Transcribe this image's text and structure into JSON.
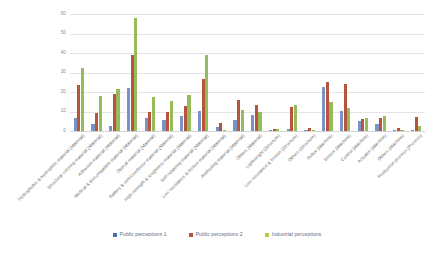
{
  "chart_data": {
    "type": "bar",
    "title": "",
    "subtitle": "",
    "xlabel": "",
    "ylabel": "",
    "ylim": [
      0,
      60
    ],
    "yticks": [
      0,
      10,
      20,
      30,
      40,
      50,
      60
    ],
    "ytick_labels": [
      "0",
      "10",
      "20",
      "30",
      "40",
      "50",
      "60"
    ],
    "grid": true,
    "legend_position": "bottom",
    "categories": [
      "Hydrophobic & hydrophilic material (Material)",
      "Structural coloring material (Material)",
      "Adhesive material (Material)",
      "Medical & biocompatible material (Material)",
      "Optical material (Material)",
      "Battery & semiconductor material (Material)",
      "High strength & toughness material (Material)",
      "Self-repairing material (Material)",
      "Low resistance & friction material (Material)",
      "Antifouling material (Material)",
      "Others (Material)",
      "Lightweight (Structure)",
      "Low resistance & friction (Structure)",
      "Others (Structure)",
      "Robot (Machine)",
      "Sensor (Machine)",
      "Control (Machine)",
      "Actuator (Machine)",
      "Others (Machine)",
      "Production process (Process)"
    ],
    "series": [
      {
        "name": "Public perceptions 1",
        "color": "#4a6fb5",
        "values": [
          6.5,
          3.5,
          2.5,
          22.0,
          6.5,
          5.5,
          7.5,
          10.5,
          2.0,
          5.5,
          8.0,
          0.5,
          1.0,
          0.5,
          22.5,
          10.5,
          5.0,
          3.5,
          0.3,
          0.5
        ]
      },
      {
        "name": "Public perceptions 2",
        "color": "#b4553c",
        "values": [
          23.5,
          9.0,
          19.0,
          39.0,
          10.0,
          10.0,
          13.0,
          26.5,
          4.0,
          16.0,
          13.5,
          1.0,
          12.5,
          1.5,
          25.0,
          24.0,
          6.0,
          6.5,
          1.5,
          7.0
        ]
      },
      {
        "name": "Industrial perceptions",
        "color": "#96bb5b",
        "values": [
          32.5,
          18.0,
          21.5,
          58.0,
          17.5,
          15.5,
          18.5,
          39.0,
          0.3,
          11.0,
          9.5,
          1.0,
          13.5,
          0.5,
          15.0,
          12.0,
          6.5,
          7.5,
          0.5,
          2.5
        ]
      }
    ]
  },
  "legend": {
    "items": [
      {
        "label": "Public perceptions 1",
        "color": "#4a6fb5"
      },
      {
        "label": "Public perceptions 2",
        "color": "#b4553c"
      },
      {
        "label": "Industrial perceptions",
        "color": "#b7c943"
      }
    ]
  }
}
